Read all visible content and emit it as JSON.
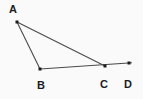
{
  "diagram": {
    "background_color": "#fafafa",
    "line_color": "#4a4a4a",
    "point_color": "#1c1c1c",
    "label_color": "#1c1c1c",
    "width": 143,
    "height": 99,
    "points": [
      {
        "label": "A",
        "x": 17,
        "y": 22,
        "label_x": 13,
        "label_y": 13,
        "dot_size": 3
      },
      {
        "label": "B",
        "x": 40,
        "y": 69,
        "label_x": 41,
        "label_y": 89,
        "dot_size": 3
      },
      {
        "label": "C",
        "x": 105,
        "y": 66,
        "label_x": 104,
        "label_y": 88,
        "dot_size": 3
      },
      {
        "label": "D",
        "x": 129,
        "y": 63,
        "label_x": 128,
        "label_y": 88,
        "dot_size": 3
      }
    ],
    "segments": [
      {
        "name": "segment-AB",
        "from": "A",
        "to": "B"
      },
      {
        "name": "segment-AC",
        "from": "A",
        "to": "C"
      },
      {
        "name": "segment-BD",
        "from": "B",
        "to": "D",
        "overshoot": 3
      }
    ],
    "stroke_width": 1.1
  }
}
